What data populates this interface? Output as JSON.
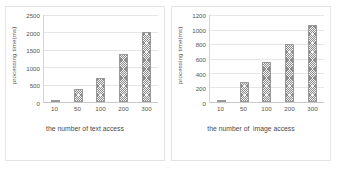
{
  "chart_data": [
    {
      "type": "bar",
      "title": "",
      "xlabel": "the number of text access",
      "ylabel": "processing time(ms)",
      "categories": [
        "10",
        "50",
        "100",
        "200",
        "300"
      ],
      "values": [
        60,
        380,
        700,
        1370,
        2000
      ],
      "ylim": [
        0,
        2500
      ],
      "yticks": [
        0,
        500,
        1000,
        1500,
        2000,
        2500
      ],
      "grid": true,
      "legend": "none",
      "bar_fill": "#f2f2f2",
      "bar_hatch": "crosshatch",
      "bar_edge": "#999999"
    },
    {
      "type": "bar",
      "title": "",
      "xlabel": "the number of  image access",
      "ylabel": "processing time(ms)",
      "categories": [
        "10",
        "50",
        "100",
        "200",
        "300"
      ],
      "values": [
        30,
        270,
        550,
        805,
        1065
      ],
      "ylim": [
        0,
        1200
      ],
      "yticks": [
        0,
        200,
        400,
        600,
        800,
        1000,
        1200
      ],
      "grid": true,
      "legend": "none",
      "bar_fill": "#f2f2f2",
      "bar_hatch": "crosshatch",
      "bar_edge": "#999999"
    }
  ],
  "panels": [
    {
      "ylabel": "processing time(ms)",
      "xlabel": "the number of text access",
      "yticks": [
        "2500",
        "2000",
        "1500",
        "1000",
        "500",
        "0"
      ],
      "xticks": [
        "10",
        "50",
        "100",
        "200",
        "300"
      ]
    },
    {
      "ylabel": "processing time(ms)",
      "xlabel": "the number of  image access",
      "yticks": [
        "1200",
        "1000",
        "800",
        "600",
        "400",
        "200",
        "0"
      ],
      "xticks": [
        "10",
        "50",
        "100",
        "200",
        "300"
      ]
    }
  ]
}
